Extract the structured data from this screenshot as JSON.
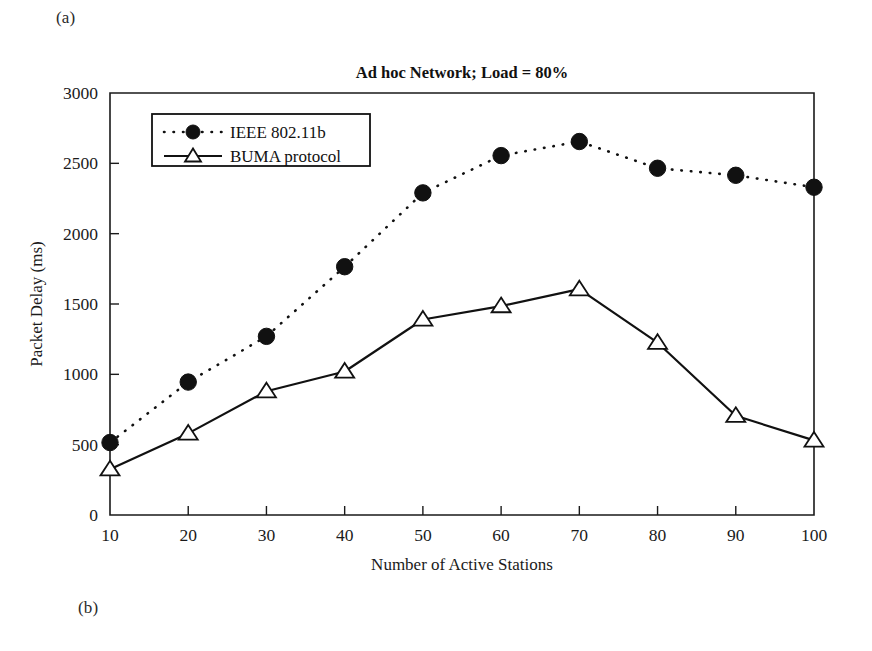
{
  "figure": {
    "panel_label_a": "(a)",
    "panel_label_b": "(b)"
  },
  "chart_data": {
    "type": "line",
    "title": "Ad hoc Network; Load = 80%",
    "xlabel": "Number of Active Stations",
    "ylabel": "Packet Delay (ms)",
    "x": [
      10,
      20,
      30,
      40,
      50,
      60,
      70,
      80,
      90,
      100
    ],
    "xticklabels": [
      "10",
      "20",
      "30",
      "40",
      "50",
      "60",
      "70",
      "80",
      "90",
      "100"
    ],
    "yticks": [
      0,
      500,
      1000,
      1500,
      2000,
      2500,
      3000
    ],
    "yticklabels": [
      "0",
      "500",
      "1000",
      "1500",
      "2000",
      "2500",
      "3000"
    ],
    "xlim": [
      10,
      100
    ],
    "ylim": [
      0,
      3000
    ],
    "grid": false,
    "legend_position": "upper left",
    "series": [
      {
        "name": "IEEE 802.11b",
        "marker": "filled-circle",
        "linestyle": "dotted",
        "color": "#111111",
        "values": [
          515,
          945,
          1270,
          1765,
          2290,
          2555,
          2655,
          2465,
          2415,
          2330
        ]
      },
      {
        "name": "BUMA protocol",
        "marker": "open-triangle",
        "linestyle": "solid",
        "color": "#111111",
        "values": [
          325,
          580,
          880,
          1020,
          1390,
          1485,
          1605,
          1225,
          705,
          530
        ]
      }
    ]
  }
}
